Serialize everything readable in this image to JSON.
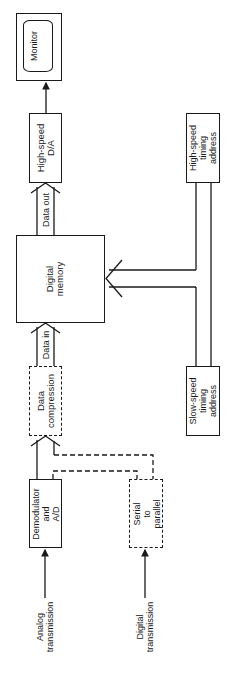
{
  "diagram": {
    "type": "block-diagram",
    "orientation": "rotated-90-ccw",
    "blocks": {
      "monitor": {
        "label": "Monitor"
      },
      "dac": {
        "label": "High-speed\nD/A"
      },
      "memory": {
        "label": "Digital\nmemory"
      },
      "compression": {
        "label": "Data\ncompression",
        "style": "dashed"
      },
      "demodulator": {
        "label": "Demodulator\nand\nA/D"
      },
      "serial": {
        "label": "Serial\nto\nparallel",
        "style": "dashed"
      },
      "hs_timing": {
        "label": "High-speed\ntiming\naddress"
      },
      "ls_timing": {
        "label": "Slow-speed\ntiming\naddress"
      }
    },
    "buses": {
      "data_out": {
        "label": "Data out"
      },
      "data_in": {
        "label": "Data in"
      }
    },
    "inputs": {
      "analog": {
        "label": "Analog\ntransmission"
      },
      "digital": {
        "label": "Digital\ntransmission"
      }
    }
  }
}
